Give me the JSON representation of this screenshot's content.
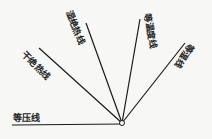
{
  "diagram": {
    "type": "thermodynamic-line-family",
    "origin": {
      "x": 122,
      "y": 123
    },
    "lines": [
      {
        "id": "isobar",
        "label": "等压线",
        "end": {
          "x": 12,
          "y": 125
        }
      },
      {
        "id": "dry-adiabat",
        "label": "干绝热线",
        "end": {
          "x": 39,
          "y": 48
        }
      },
      {
        "id": "moist-adiabat",
        "label": "湿绝热线",
        "end": {
          "x": 86,
          "y": 23
        }
      },
      {
        "id": "isotherm",
        "label": "等温度线",
        "end": {
          "x": 140,
          "y": 19
        }
      },
      {
        "id": "iso-humidity",
        "label": "等湿线",
        "end": {
          "x": 185,
          "y": 43
        }
      }
    ],
    "colors": {
      "line": "#1a1a1a",
      "background": "#f7f7f5",
      "text": "#222222"
    }
  }
}
